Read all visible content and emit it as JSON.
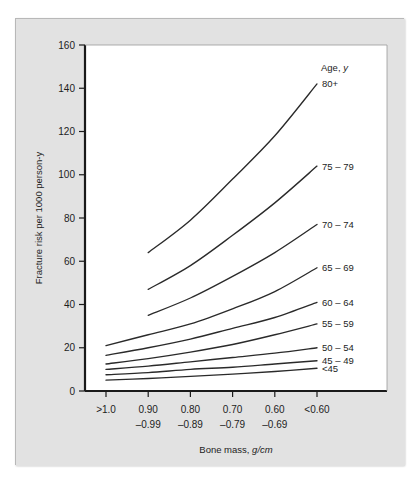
{
  "chart_data": {
    "type": "line",
    "title": "",
    "xlabel": "Bone mass, g/cm",
    "ylabel": "Fracture risk per 1000 person-y",
    "xlabel_plain": "Bone mass, ",
    "xlabel_italic": "g/cm",
    "legend_title": "Age, y",
    "legend_position": "right-inline-end-of-line",
    "grid": false,
    "ylim": [
      0,
      160
    ],
    "yticks": [
      0,
      20,
      40,
      60,
      80,
      100,
      120,
      140,
      160
    ],
    "ytick_labels": [
      "0",
      "20",
      "40",
      "60",
      "80",
      "100",
      "120",
      "140",
      "160"
    ],
    "categories": [
      ">1.0",
      "0.90 -0.99",
      "0.80 -0.89",
      "0.70 -0.79",
      "0.60 -0.69",
      "<0.60"
    ],
    "xtick_labels_line1": [
      ">1.0",
      "0.90",
      "0.80",
      "0.70",
      "0.60",
      "<0.60"
    ],
    "xtick_labels_line2": [
      "",
      "–0.99",
      "–0.89",
      "–0.79",
      "–0.69",
      ""
    ],
    "series": [
      {
        "name": "80+",
        "label": "80+",
        "x": [
          1,
          2,
          3,
          4,
          5
        ],
        "values": [
          64,
          79,
          98,
          118,
          142
        ]
      },
      {
        "name": "75-79",
        "label": "75 – 79",
        "x": [
          1,
          2,
          3,
          4,
          5
        ],
        "values": [
          47,
          58,
          72,
          87,
          104
        ]
      },
      {
        "name": "70-74",
        "label": "70 – 74",
        "x": [
          1,
          2,
          3,
          4,
          5
        ],
        "values": [
          35,
          43,
          53,
          64,
          77
        ]
      },
      {
        "name": "65-69",
        "label": "65 – 69",
        "x": [
          0,
          1,
          2,
          3,
          4,
          5
        ],
        "values": [
          21,
          26,
          31,
          38,
          46,
          57
        ]
      },
      {
        "name": "60-64",
        "label": "60 – 64",
        "x": [
          0,
          1,
          2,
          3,
          4,
          5
        ],
        "values": [
          16.5,
          20,
          24,
          29,
          34,
          41
        ]
      },
      {
        "name": "55-59",
        "label": "55 – 59",
        "x": [
          0,
          1,
          2,
          3,
          4,
          5
        ],
        "values": [
          12.5,
          15,
          18,
          21.5,
          26,
          31
        ]
      },
      {
        "name": "50-54",
        "label": "50 – 54",
        "x": [
          0,
          1,
          2,
          3,
          4,
          5
        ],
        "values": [
          10,
          11.5,
          13.5,
          15.5,
          17.5,
          20
        ]
      },
      {
        "name": "45-49",
        "label": "45 – 49",
        "x": [
          0,
          1,
          2,
          3,
          4,
          5
        ],
        "values": [
          7.5,
          8.5,
          10,
          11,
          12.5,
          14
        ]
      },
      {
        "name": "<45",
        "label": "<45",
        "x": [
          0,
          1,
          2,
          3,
          4,
          5
        ],
        "values": [
          5,
          5.8,
          6.8,
          7.8,
          9,
          10.5
        ]
      }
    ],
    "line_color": "#2a2a2a",
    "plot_background": "#ffffff",
    "panel_background": "#e2e2e2",
    "axis_color": "#1a1a1a"
  }
}
